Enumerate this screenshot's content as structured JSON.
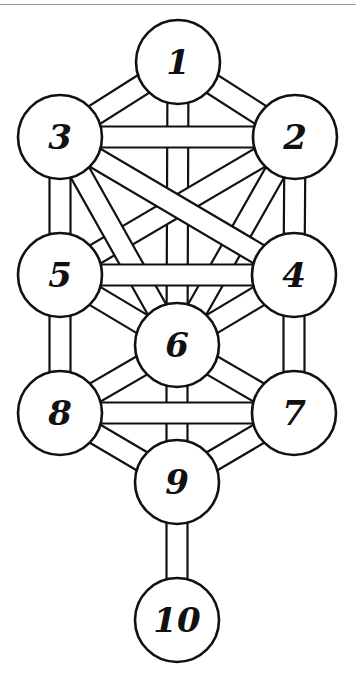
{
  "diagram": {
    "colors": {
      "line": "#111111",
      "fill": "#ffffff",
      "background": "#ffffff"
    },
    "nodes": [
      {
        "id": "1",
        "label": "1"
      },
      {
        "id": "2",
        "label": "2"
      },
      {
        "id": "3",
        "label": "3"
      },
      {
        "id": "4",
        "label": "4"
      },
      {
        "id": "5",
        "label": "5"
      },
      {
        "id": "6",
        "label": "6"
      },
      {
        "id": "7",
        "label": "7"
      },
      {
        "id": "8",
        "label": "8"
      },
      {
        "id": "9",
        "label": "9"
      },
      {
        "id": "10",
        "label": "10"
      }
    ],
    "paths": [
      [
        "1",
        "2"
      ],
      [
        "1",
        "3"
      ],
      [
        "1",
        "6"
      ],
      [
        "2",
        "3"
      ],
      [
        "2",
        "4"
      ],
      [
        "2",
        "5"
      ],
      [
        "2",
        "6"
      ],
      [
        "3",
        "4"
      ],
      [
        "3",
        "5"
      ],
      [
        "3",
        "6"
      ],
      [
        "4",
        "5"
      ],
      [
        "4",
        "6"
      ],
      [
        "4",
        "7"
      ],
      [
        "5",
        "6"
      ],
      [
        "5",
        "8"
      ],
      [
        "6",
        "7"
      ],
      [
        "6",
        "8"
      ],
      [
        "6",
        "9"
      ],
      [
        "7",
        "8"
      ],
      [
        "7",
        "9"
      ],
      [
        "8",
        "9"
      ],
      [
        "9",
        "10"
      ]
    ]
  }
}
